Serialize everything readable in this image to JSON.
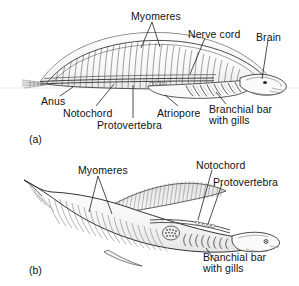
{
  "figure": {
    "background_color": "#ffffff",
    "ink_color": "#2b2b2b",
    "leader_color": "#1a1a1a",
    "fill_light": "#fbfbfb",
    "fill_shade": "#ededed"
  },
  "panels": [
    {
      "tag": "(a)",
      "name": "lancelet-like-chordate",
      "labels": [
        {
          "key": "myomeres",
          "text": "Myomeres"
        },
        {
          "key": "nerve_cord",
          "text": "Nerve cord"
        },
        {
          "key": "brain",
          "text": "Brain"
        },
        {
          "key": "anus",
          "text": "Anus"
        },
        {
          "key": "notochord",
          "text": "Notochord"
        },
        {
          "key": "protovertebra",
          "text": "Protovertebra"
        },
        {
          "key": "atriopore",
          "text": "Atriopore"
        },
        {
          "key": "branchial_bar_line1",
          "text": "Branchial bar"
        },
        {
          "key": "branchial_bar_line2",
          "text": "with gills"
        }
      ]
    },
    {
      "tag": "(b)",
      "name": "craniate-like-chordate",
      "labels": [
        {
          "key": "myomeres",
          "text": "Myomeres"
        },
        {
          "key": "notochord",
          "text": "Notochord"
        },
        {
          "key": "protovertebra",
          "text": "Protovertebra"
        },
        {
          "key": "branchial_bar_line1",
          "text": "Branchial bar"
        },
        {
          "key": "branchial_bar_line2",
          "text": "with gills"
        }
      ]
    }
  ],
  "panel_a": {
    "tag": "(a)",
    "myomeres": "Myomeres",
    "nerve_cord": "Nerve cord",
    "brain": "Brain",
    "anus": "Anus",
    "notochord": "Notochord",
    "protovertebra": "Protovertebra",
    "atriopore": "Atriopore",
    "branchial_bar_line1": "Branchial bar",
    "branchial_bar_line2": "with gills"
  },
  "panel_b": {
    "tag": "(b)",
    "myomeres": "Myomeres",
    "notochord": "Notochord",
    "protovertebra": "Protovertebra",
    "branchial_bar_line1": "Branchial bar",
    "branchial_bar_line2": "with gills"
  }
}
